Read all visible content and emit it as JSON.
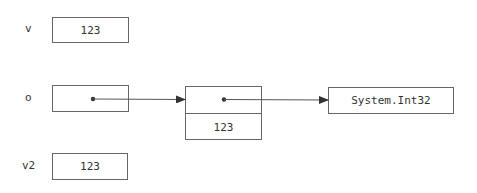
{
  "diagram": {
    "variables": [
      {
        "name": "v",
        "value": "123"
      },
      {
        "name": "o",
        "value": ""
      },
      {
        "name": "v2",
        "value": "123"
      }
    ],
    "heap_object": {
      "header_value": "",
      "boxed_value": "123"
    },
    "type_object": {
      "label": "System.Int32"
    },
    "colors": {
      "stroke": "#666666",
      "text": "#333333",
      "pointer": "#333333",
      "background": "#ffffff"
    }
  }
}
